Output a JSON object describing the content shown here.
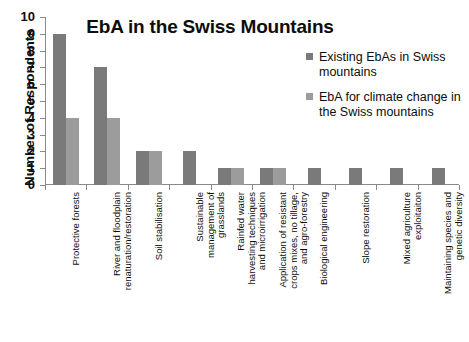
{
  "chart_data": {
    "type": "bar",
    "title": "EbA in the Swiss Mountains",
    "xlabel": "",
    "ylabel": "Number of Respondents",
    "ylim": [
      0,
      10
    ],
    "ytick_labels": [
      "10",
      "9",
      "8",
      "7",
      "6",
      "5",
      "4",
      "3",
      "2",
      "1",
      "0"
    ],
    "grid": false,
    "legend_position": "top-right",
    "categories": [
      "Protective forests",
      "River and floodplain\nrenaturation/restoration",
      "Soil stabilisation",
      "Sustainable\nmanagement of\ngrasslands",
      "Rainfed water\nharvesting techniques\nand microirrigation",
      "Application of resistant\ncrops mixes, no tillage,\nand agro-forestry",
      "Biological engineering",
      "Slope restoration",
      "Mixed agriculture\nexploitaiton",
      "Maintaining species and\ngenetic diversity"
    ],
    "series": [
      {
        "name": "Existing EbAs in Swiss mountains",
        "color": "#7a7a7a",
        "values": [
          9,
          7,
          2,
          2,
          1,
          1,
          1,
          1,
          1,
          1
        ]
      },
      {
        "name": "EbA for climate change in the Swiss mountains",
        "color": "#9c9c9c",
        "values": [
          4,
          4,
          2,
          null,
          1,
          1,
          null,
          null,
          null,
          null
        ]
      }
    ]
  },
  "legend": {
    "entries": [
      {
        "label": "Existing EbAs in Swiss mountains"
      },
      {
        "label": "EbA for climate change in the Swiss mountains"
      }
    ]
  }
}
